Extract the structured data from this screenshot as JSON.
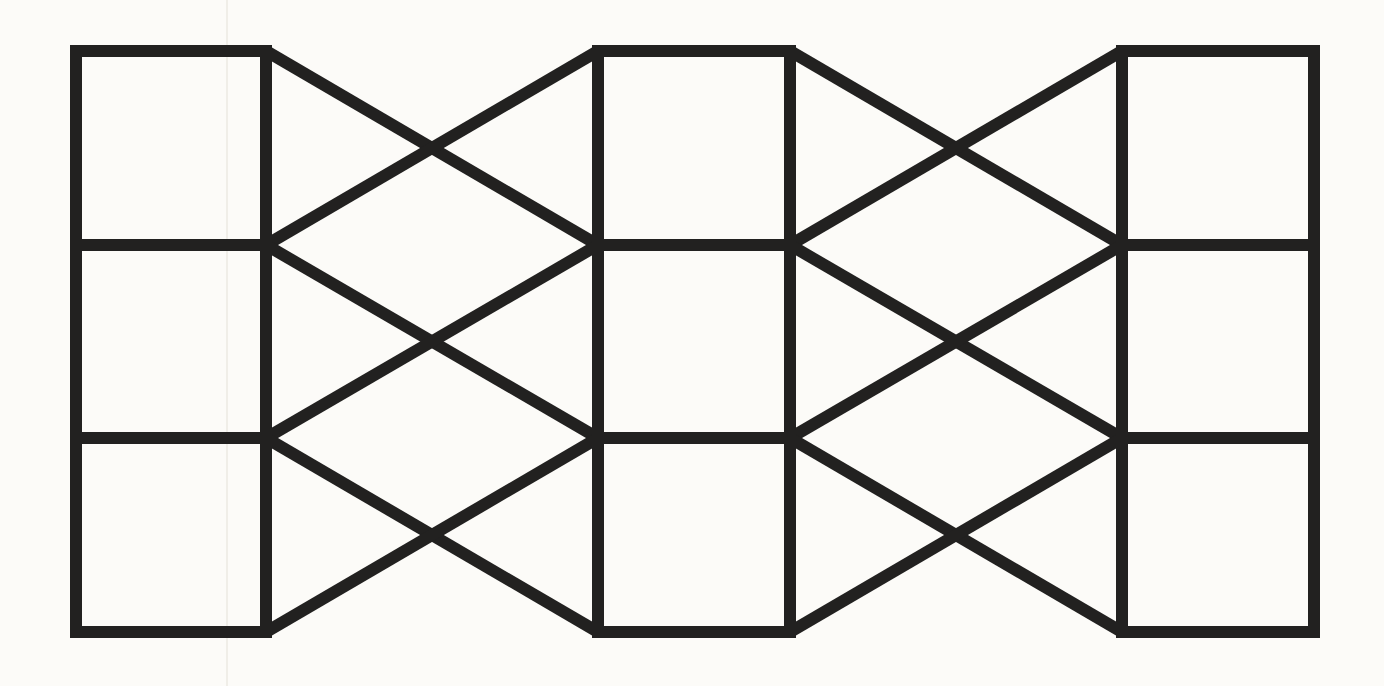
{
  "figure": {
    "type": "line-drawing",
    "canvas": {
      "width": 1384,
      "height": 686
    },
    "background_color": "#fcfbf8",
    "stroke_color": "#222120",
    "stroke_width": 12,
    "columns": [
      {
        "x_left": 76,
        "x_right": 266
      },
      {
        "x_left": 598,
        "x_right": 790
      },
      {
        "x_left": 1122,
        "x_right": 1314
      }
    ],
    "row_lines_y": [
      51,
      245,
      438,
      632
    ],
    "diagonal_bands": [
      [
        0,
        1
      ],
      [
        1,
        2
      ]
    ],
    "scan_artifact": {
      "x": 227,
      "width": 2,
      "color": "#f0eee8"
    }
  }
}
